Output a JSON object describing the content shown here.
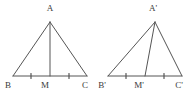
{
  "figure": {
    "background_color": "#ffffff",
    "stroke_color": "#555555",
    "label_color": "#3a3a3a",
    "tick_color": "#555555",
    "stroke_width": 1,
    "triangles": [
      {
        "id": "triangle-left",
        "name": "ABC",
        "apex": {
          "label": "A",
          "x": 50,
          "y": 22,
          "label_x": 50,
          "label_y": 11
        },
        "left_base": {
          "label": "B",
          "x": 13,
          "y": 76,
          "label_x": 8,
          "label_y": 88
        },
        "right_base": {
          "label": "C",
          "x": 87,
          "y": 76,
          "label_x": 85,
          "label_y": 88
        },
        "midpoint": {
          "label": "M",
          "x": 50,
          "y": 76,
          "label_x": 45,
          "label_y": 88
        },
        "median_label": "AM",
        "ticks": [
          {
            "name": "tick-bm",
            "x": 31,
            "y": 76
          },
          {
            "name": "tick-mc",
            "x": 69,
            "y": 76
          }
        ]
      },
      {
        "id": "triangle-right",
        "name": "A'B'C'",
        "apex": {
          "label": "A'",
          "x": 155,
          "y": 22,
          "label_x": 153,
          "label_y": 11
        },
        "left_base": {
          "label": "B'",
          "x": 108,
          "y": 76,
          "label_x": 102,
          "label_y": 88
        },
        "right_base": {
          "label": "C'",
          "x": 182,
          "y": 76,
          "label_x": 179,
          "label_y": 88
        },
        "midpoint": {
          "label": "M'",
          "x": 145,
          "y": 76,
          "label_x": 139,
          "label_y": 88
        },
        "median_label": "A'M'",
        "ticks": [
          {
            "name": "tick-bm-prime",
            "x": 126,
            "y": 76
          },
          {
            "name": "tick-mc-prime",
            "x": 164,
            "y": 76
          }
        ]
      }
    ]
  }
}
